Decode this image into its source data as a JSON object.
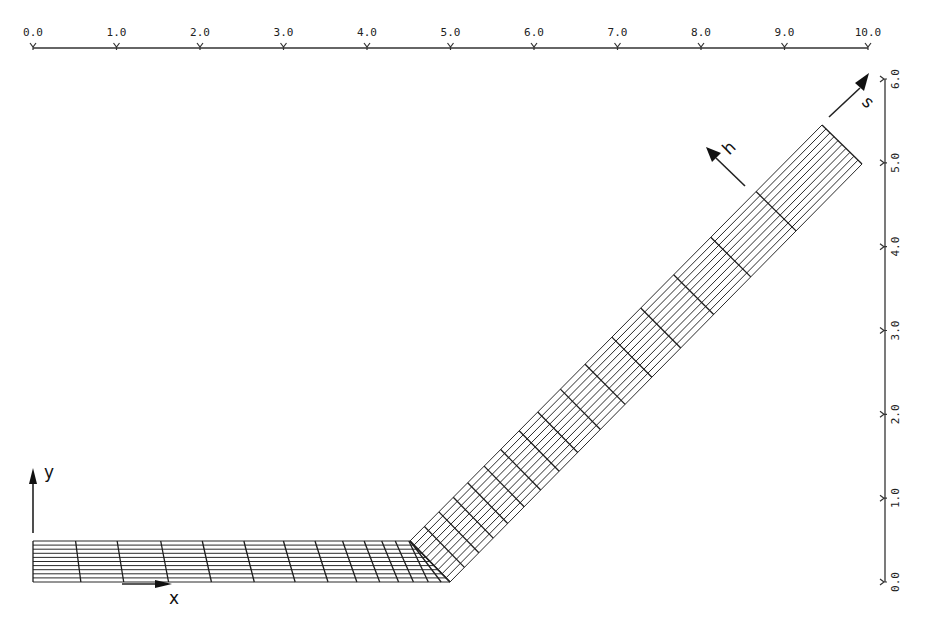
{
  "figure": {
    "type": "computational mesh diagram"
  },
  "top_axis": {
    "tick_labels": [
      "0.0",
      "1.0",
      "2.0",
      "3.0",
      "4.0",
      "5.0",
      "6.0",
      "7.0",
      "8.0",
      "9.0",
      "10.0"
    ],
    "range": [
      0.0,
      10.0
    ]
  },
  "right_axis": {
    "tick_labels": [
      "0.0",
      "1.0",
      "2.0",
      "3.0",
      "4.0",
      "5.0",
      "6.0"
    ],
    "range": [
      0.0,
      6.0
    ]
  },
  "labels": {
    "x_axis": "x",
    "y_axis": "y",
    "h_dir": "h",
    "s_dir": "s"
  },
  "colors": {
    "ink": "#222222",
    "background": "#ffffff"
  },
  "mesh": {
    "horizontal_strip": {
      "x_start": 0.0,
      "x_end_top": 4.5,
      "x_end_bottom": 5.0,
      "y_bottom": 0.0,
      "y_top": 0.5,
      "layers": 10
    },
    "inclined_strip": {
      "angle_deg": 42,
      "end_top_corner": [
        9.45,
        5.45
      ],
      "end_bottom_corner": [
        9.95,
        5.0
      ],
      "layers": 10
    }
  }
}
